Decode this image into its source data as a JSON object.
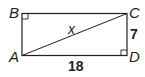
{
  "diagram": {
    "type": "rectangle-with-diagonal",
    "vertices": {
      "top_left": "B",
      "top_right": "C",
      "bottom_left": "A",
      "bottom_right": "D"
    },
    "diagonal": {
      "from": "A",
      "to": "C",
      "label": "x"
    },
    "side_labels": {
      "right_CD": "7",
      "bottom_AD": "18"
    },
    "right_angle_marks": [
      "B",
      "D"
    ],
    "colors": {
      "stroke": "#231f20",
      "background": "#ffffff"
    }
  }
}
